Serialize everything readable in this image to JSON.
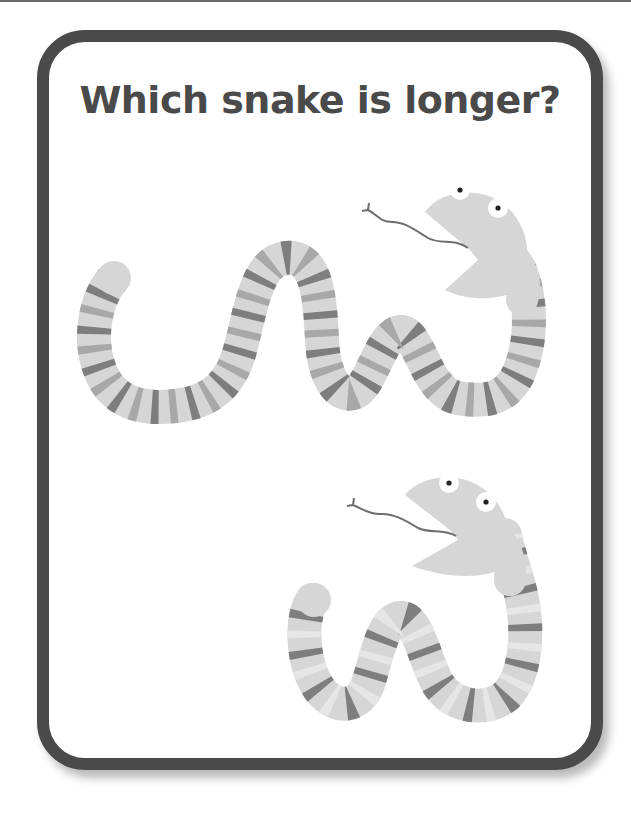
{
  "worksheet": {
    "title": "Which snake is longer?",
    "colors": {
      "border": "#4a4a4a",
      "title_text": "#4a4a4a",
      "snake_body": "#d6d6d6",
      "stripe_dark": "#7e7e7e",
      "stripe_mid": "#a8a8a8",
      "stripe_light": "#e4e4e4",
      "tongue": "#6e6e6e",
      "eye_white": "#ffffff",
      "pupil": "#222222"
    },
    "snakes": [
      {
        "id": "snake-top",
        "description": "long striped snake with open mouth and forked tongue"
      },
      {
        "id": "snake-bottom",
        "description": "short striped snake with open mouth and forked tongue"
      }
    ]
  }
}
